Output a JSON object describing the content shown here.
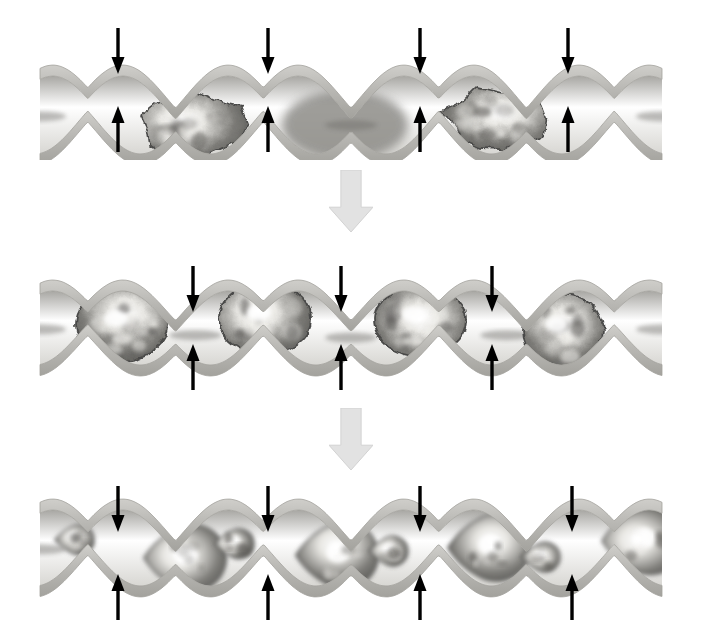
{
  "figure": {
    "title": "Three-stage schematic of particulate masses transported and progressively broken up inside a peristaltic wavy tube",
    "background_color": "#ffffff",
    "width": 702,
    "height": 637,
    "palette": {
      "tube_wall": "#b9b8b4",
      "tube_wall_edge": "#a3a29d",
      "tube_lumen": "#ffffff",
      "lumen_shadow": "#8d8c88",
      "mass_dark": "#4a4a48",
      "mass_mid": "#7c7b77",
      "mass_light": "#e8e7e3",
      "mass_highlight": "#ffffff",
      "compression_arrow": "#000000",
      "transition_arrow": "#e2e2e2",
      "transition_arrow_edge": "#d2d2d2"
    },
    "rows": [
      {
        "id": "stage-1",
        "label": "Stage 1 - intact large aggregates",
        "top": 20,
        "height": 140,
        "wave_count": 4,
        "tube_axis_y": 95,
        "amplitude": 34,
        "wall_thickness": 11,
        "compression_arrows": {
          "count": 8,
          "down_y_top": 28,
          "down_y_tip": 66,
          "up_y_bottom": 152,
          "up_y_tip": 114,
          "x_positions": [
            118,
            268,
            420,
            568
          ]
        },
        "bulges": [
          {
            "index": 0,
            "cx": 190,
            "rx": 62,
            "ry": 40,
            "mass": "angular-aggregate",
            "mass_rx": 52,
            "mass_ry": 33,
            "filled": true
          },
          {
            "index": 1,
            "cx": 345,
            "rx": 66,
            "ry": 41,
            "mass": "none",
            "filled": false
          },
          {
            "index": 2,
            "cx": 497,
            "rx": 62,
            "ry": 40,
            "mass": "angular-aggregate",
            "mass_rx": 52,
            "mass_ry": 33,
            "filled": true
          }
        ]
      },
      {
        "id": "stage-2",
        "label": "Stage 2 - rounded compacted masses",
        "top": 258,
        "height": 140,
        "wave_count": 4,
        "tube_axis_y": 70,
        "amplitude": 32,
        "wall_thickness": 11,
        "compression_arrows": {
          "count": 6,
          "down_y_top": 258,
          "down_y_tip": 298,
          "up_y_bottom": 392,
          "up_y_tip": 352,
          "x_positions": [
            193,
            341,
            492
          ]
        },
        "bulges": [
          {
            "index": 0,
            "cx": 122,
            "rx": 60,
            "ry": 40,
            "mass": "round-mass",
            "mass_rx": 46,
            "mass_ry": 36,
            "filled": true
          },
          {
            "index": 1,
            "cx": 265,
            "rx": 60,
            "ry": 40,
            "mass": "round-mass",
            "mass_rx": 46,
            "mass_ry": 36,
            "filled": true
          },
          {
            "index": 2,
            "cx": 420,
            "rx": 60,
            "ry": 40,
            "mass": "round-mass",
            "mass_rx": 46,
            "mass_ry": 36,
            "filled": true
          },
          {
            "index": 3,
            "cx": 563,
            "rx": 64,
            "ry": 40,
            "mass": "round-mass",
            "mass_rx": 40,
            "mass_ry": 36,
            "filled": true
          }
        ]
      },
      {
        "id": "stage-3",
        "label": "Stage 3 - fragmented teardrop particles",
        "top": 478,
        "height": 150,
        "wave_count": 4,
        "tube_axis_y": 70,
        "amplitude": 33,
        "wall_thickness": 11,
        "compression_arrows": {
          "count": 8,
          "down_y_top": 478,
          "down_y_tip": 520,
          "up_y_bottom": 628,
          "up_y_tip": 586,
          "x_positions": [
            118,
            268,
            420,
            572
          ]
        },
        "bulges": [
          {
            "index": 0,
            "cx": 72,
            "rx": 42,
            "ry": 38,
            "mass": "teardrop-small",
            "filled": true
          },
          {
            "index": 1,
            "cx": 178,
            "rx": 58,
            "ry": 40,
            "mass": "teardrop-large",
            "filled": true
          },
          {
            "index": 2,
            "cx": 232,
            "rx": 26,
            "ry": 22,
            "mass": "teardrop-small",
            "filled": true
          },
          {
            "index": 3,
            "cx": 330,
            "rx": 58,
            "ry": 40,
            "mass": "teardrop-large",
            "filled": true
          },
          {
            "index": 4,
            "cx": 386,
            "rx": 26,
            "ry": 22,
            "mass": "teardrop-small",
            "filled": true
          },
          {
            "index": 5,
            "cx": 482,
            "rx": 58,
            "ry": 40,
            "mass": "teardrop-large",
            "filled": true
          },
          {
            "index": 6,
            "cx": 538,
            "rx": 26,
            "ry": 22,
            "mass": "teardrop-small",
            "filled": true
          },
          {
            "index": 7,
            "cx": 636,
            "rx": 56,
            "ry": 40,
            "mass": "teardrop-large",
            "filled": true
          }
        ]
      }
    ],
    "transitions": [
      {
        "id": "transition-1",
        "from": "stage-1",
        "to": "stage-2",
        "cx": 348,
        "top": 170,
        "width": 44,
        "height": 62,
        "direction": "down"
      },
      {
        "id": "transition-2",
        "from": "stage-2",
        "to": "stage-3",
        "cx": 348,
        "top": 408,
        "width": 44,
        "height": 62,
        "direction": "down"
      }
    ]
  }
}
